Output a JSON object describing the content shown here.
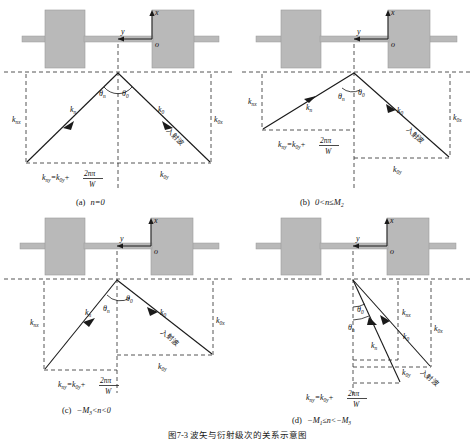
{
  "figure": {
    "bottom_caption": "图7-3  波矢与衍射级次的关系示意图",
    "axis_x": "x",
    "axis_y": "y",
    "origin": "o",
    "incident_wave_cjk": "入射波"
  },
  "symbols": {
    "k0": "k",
    "k0_sub": "0",
    "kn": "k",
    "kn_sub": "n",
    "theta_n": "θ",
    "theta_n_sub": "n",
    "theta_0": "θ",
    "theta_0_sub": "0",
    "k_nx": "k",
    "k_nx_sub": "nx",
    "k_ny": "k",
    "k_ny_sub": "ny",
    "k_0x": "k",
    "k_0x_sub": "0x",
    "k_0y": "k",
    "k_0y_sub": "0y",
    "two_n_pi": "2nπ",
    "W": "W",
    "eq_lhs": "k",
    "eq_lhs_sub": "ny",
    "eq_mid": "=k",
    "eq_mid_sub": "0y",
    "eq_plus": "+"
  },
  "panels": [
    {
      "id": "a",
      "caption_label": "(a)",
      "caption_cond": "n=0",
      "description": "symmetric: kn to lower-left, k0 to lower-right, equal angles"
    },
    {
      "id": "b",
      "caption_label": "(b)",
      "caption_cond": "0<n≤M",
      "caption_cond_sub": "2",
      "description": "kn shallow to lower-left, k0 steeper to lower-right"
    },
    {
      "id": "c",
      "caption_label": "(c)",
      "caption_cond": "−M",
      "caption_cond_sub": "3",
      "caption_cond_tail": "<n<0",
      "description": "kn steep to lower-left, k0 shallow to lower-right"
    },
    {
      "id": "d",
      "caption_label": "(d)",
      "caption_cond": "−M",
      "caption_cond_sub": "1",
      "caption_cond_mid": "≤n<−M",
      "caption_cond_sub2": "3",
      "description": "both kn and k0 point to lower-right, small angles"
    }
  ],
  "colors": {
    "block_fill": "#b9b9b9",
    "block_stroke": "#9a9a9a",
    "line": "#1a1a1a",
    "dashed": "#2a2a2a"
  }
}
